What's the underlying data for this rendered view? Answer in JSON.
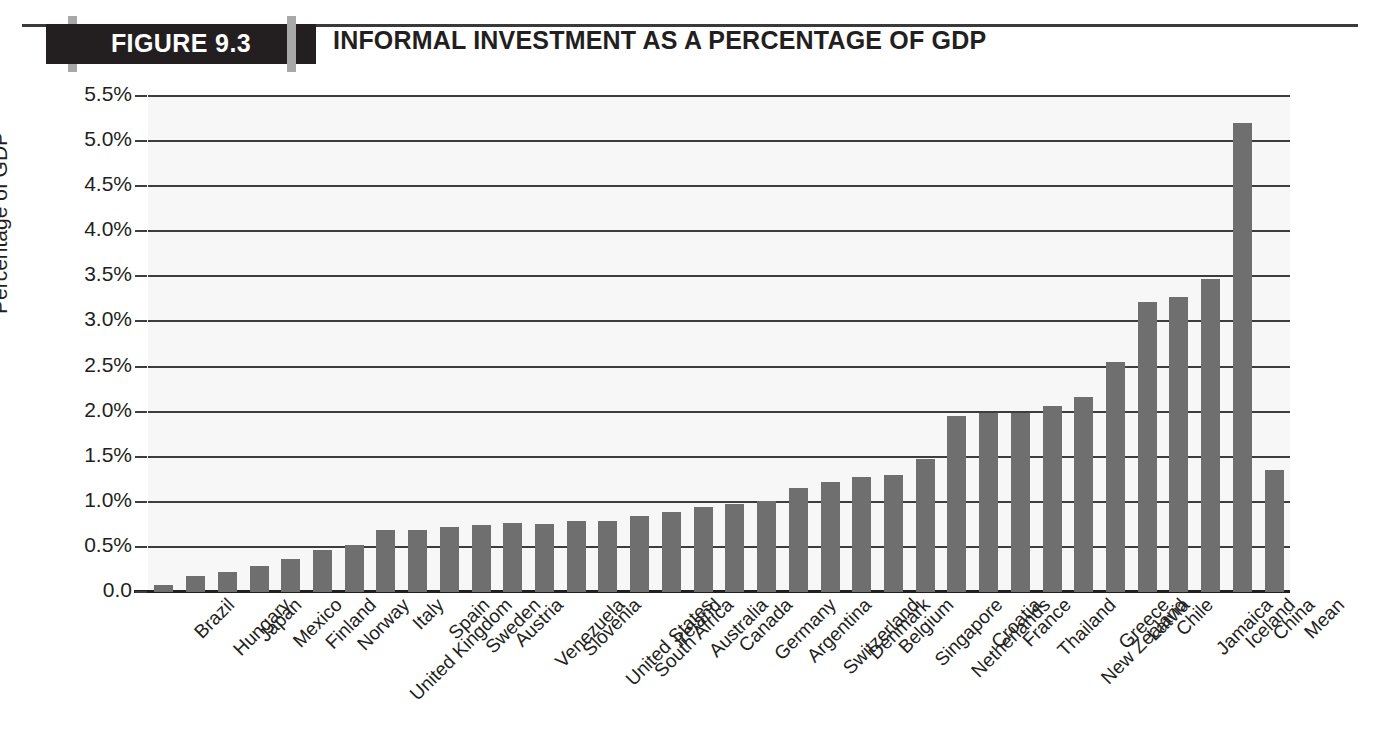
{
  "header": {
    "figure_label": "FIGURE 9.3",
    "title": "INFORMAL INVESTMENT AS A PERCENTAGE OF GDP",
    "block_color": "#231f20",
    "tick_color": "#a8a8a8"
  },
  "chart_data": {
    "type": "bar",
    "title": "INFORMAL INVESTMENT AS A PERCENTAGE OF GDP",
    "xlabel": "",
    "ylabel": "Percentage of GDP",
    "ylim": [
      0,
      5.5
    ],
    "ytick_labels": [
      "5.5%",
      "5.0%",
      "4.5%",
      "4.0%",
      "3.5%",
      "3.0%",
      "2.5%",
      "2.0%",
      "1.5%",
      "1.0%",
      "0.5%",
      "0.0"
    ],
    "ytick_values": [
      5.5,
      5.0,
      4.5,
      4.0,
      3.5,
      3.0,
      2.5,
      2.0,
      1.5,
      1.0,
      0.5,
      0.0
    ],
    "grid": true,
    "legend": "none",
    "bar_color": "#6f6f6f",
    "categories": [
      "Brazil",
      "Hungary",
      "Japan",
      "Mexico",
      "Finland",
      "Norway",
      "United Kingdom",
      "Italy",
      "Spain",
      "Sweden",
      "Austria",
      "Venezuela",
      "Slovenia",
      "United States",
      "South Africa",
      "Ireland",
      "Australia",
      "Canada",
      "Germany",
      "Argentina",
      "Switzerland",
      "Denmark",
      "Belgium",
      "Singapore",
      "Netherlands",
      "Croatia",
      "France",
      "Thailand",
      "New Zealand",
      "Greece",
      "Latvia",
      "Chile",
      "Jamaica",
      "Iceland",
      "China",
      "Mean"
    ],
    "values": [
      0.08,
      0.18,
      0.22,
      0.29,
      0.37,
      0.47,
      0.52,
      0.69,
      0.69,
      0.72,
      0.74,
      0.76,
      0.755,
      0.79,
      0.79,
      0.845,
      0.89,
      0.945,
      0.98,
      1.01,
      1.155,
      1.22,
      1.27,
      1.3,
      1.47,
      1.95,
      1.99,
      1.99,
      2.06,
      2.16,
      2.55,
      3.22,
      3.27,
      3.47,
      5.2,
      1.35
    ]
  }
}
